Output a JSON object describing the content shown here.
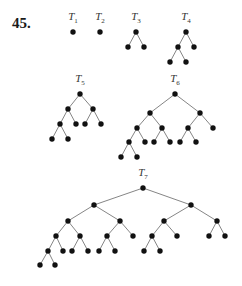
{
  "problem_number": "45.",
  "colors": {
    "node": "#111111",
    "edge": "#777777",
    "label": "#333333"
  },
  "trees": [
    {
      "name": "T1",
      "base": "T",
      "sub": "1",
      "label_pos": [
        73,
        18
      ],
      "nodes": [
        [
          73,
          32
        ]
      ],
      "edges": []
    },
    {
      "name": "T2",
      "base": "T",
      "sub": "2",
      "label_pos": [
        100,
        18
      ],
      "nodes": [
        [
          100,
          32
        ]
      ],
      "edges": []
    },
    {
      "name": "T3",
      "base": "T",
      "sub": "3",
      "label_pos": [
        136,
        18
      ],
      "nodes": [
        [
          136,
          32
        ],
        [
          128,
          47
        ],
        [
          144,
          47
        ]
      ],
      "edges": [
        [
          0,
          1
        ],
        [
          0,
          2
        ]
      ]
    },
    {
      "name": "T4",
      "base": "T",
      "sub": "4",
      "label_pos": [
        186,
        18
      ],
      "nodes": [
        [
          186,
          32
        ],
        [
          178,
          47
        ],
        [
          194,
          47
        ],
        [
          170,
          62
        ],
        [
          186,
          62
        ]
      ],
      "edges": [
        [
          0,
          1
        ],
        [
          0,
          2
        ],
        [
          1,
          3
        ],
        [
          1,
          4
        ]
      ]
    },
    {
      "name": "T5",
      "base": "T",
      "sub": "5",
      "label_pos": [
        80,
        80
      ],
      "nodes": [
        [
          80,
          94
        ],
        [
          68,
          109
        ],
        [
          93,
          109
        ],
        [
          60,
          124
        ],
        [
          76,
          124
        ],
        [
          85,
          124
        ],
        [
          101,
          124
        ],
        [
          52,
          139
        ],
        [
          68,
          139
        ]
      ],
      "edges": [
        [
          0,
          1
        ],
        [
          0,
          2
        ],
        [
          1,
          3
        ],
        [
          1,
          4
        ],
        [
          2,
          5
        ],
        [
          2,
          6
        ],
        [
          3,
          7
        ],
        [
          3,
          8
        ]
      ]
    },
    {
      "name": "T6",
      "base": "T",
      "sub": "6",
      "label_pos": [
        175,
        80
      ],
      "nodes": [
        [
          175,
          94
        ],
        [
          150,
          113
        ],
        [
          200,
          113
        ],
        [
          137,
          128
        ],
        [
          162,
          128
        ],
        [
          188,
          128
        ],
        [
          213,
          128
        ],
        [
          129,
          142
        ],
        [
          145,
          142
        ],
        [
          154,
          142
        ],
        [
          170,
          142
        ],
        [
          180,
          142
        ],
        [
          196,
          142
        ],
        [
          121,
          157
        ],
        [
          137,
          157
        ]
      ],
      "edges": [
        [
          0,
          1
        ],
        [
          0,
          2
        ],
        [
          1,
          3
        ],
        [
          1,
          4
        ],
        [
          2,
          5
        ],
        [
          2,
          6
        ],
        [
          3,
          7
        ],
        [
          3,
          8
        ],
        [
          4,
          9
        ],
        [
          4,
          10
        ],
        [
          5,
          11
        ],
        [
          5,
          12
        ],
        [
          7,
          13
        ],
        [
          7,
          14
        ]
      ]
    },
    {
      "name": "T7",
      "base": "T",
      "sub": "7",
      "label_pos": [
        143,
        174
      ],
      "nodes": [
        [
          143,
          188
        ],
        [
          94,
          205
        ],
        [
          191,
          205
        ],
        [
          68,
          221
        ],
        [
          120,
          221
        ],
        [
          164,
          221
        ],
        [
          217,
          221
        ],
        [
          56,
          236
        ],
        [
          80,
          236
        ],
        [
          107,
          236
        ],
        [
          133,
          236
        ],
        [
          152,
          236
        ],
        [
          177,
          236
        ],
        [
          209,
          236
        ],
        [
          225,
          236
        ],
        [
          48,
          251
        ],
        [
          63,
          251
        ],
        [
          72,
          251
        ],
        [
          88,
          251
        ],
        [
          99,
          251
        ],
        [
          115,
          251
        ],
        [
          144,
          251
        ],
        [
          160,
          251
        ],
        [
          40,
          265
        ],
        [
          55,
          265
        ]
      ],
      "edges": [
        [
          0,
          1
        ],
        [
          0,
          2
        ],
        [
          1,
          3
        ],
        [
          1,
          4
        ],
        [
          2,
          5
        ],
        [
          2,
          6
        ],
        [
          3,
          7
        ],
        [
          3,
          8
        ],
        [
          4,
          9
        ],
        [
          4,
          10
        ],
        [
          5,
          11
        ],
        [
          5,
          12
        ],
        [
          6,
          13
        ],
        [
          6,
          14
        ],
        [
          7,
          15
        ],
        [
          7,
          16
        ],
        [
          8,
          17
        ],
        [
          8,
          18
        ],
        [
          9,
          19
        ],
        [
          9,
          20
        ],
        [
          11,
          21
        ],
        [
          11,
          22
        ],
        [
          15,
          23
        ],
        [
          15,
          24
        ]
      ]
    }
  ]
}
